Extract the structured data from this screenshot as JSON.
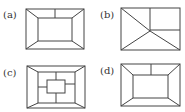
{
  "figures": [
    {
      "id": "a",
      "label": "(a)",
      "description": "Outer rectangle with inner rectangle, corners connected, one vertical tick from top edge of outer to top of inner"
    },
    {
      "id": "b",
      "label": "(b)",
      "description": "Rectangle divided by lines meeting at an interior point: diagonal from top-left, vertical to top edge, horizontal to right edge, lines to both bottom corners"
    },
    {
      "id": "c",
      "label": "(c)",
      "description": "Three nested rectangles; outer and middle connected at corners, middle and innermost connected by four short edge segments"
    },
    {
      "id": "d",
      "label": "(d)",
      "description": "Outer rectangle with inner rectangle, corners connected, one vertical tick from top edge of outer to top of inner"
    }
  ],
  "colors": {
    "line": "#444444",
    "text": "#333333",
    "background": "#ffffff"
  }
}
